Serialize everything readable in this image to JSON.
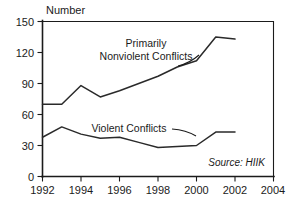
{
  "chart_data": {
    "type": "line",
    "title": "",
    "subtitle": "",
    "xlabel": "",
    "ylabel": "Number",
    "ylabel_position": "above-axis-top",
    "xlim": [
      1992,
      2004
    ],
    "ylim": [
      0,
      150
    ],
    "ytick_values": [
      0,
      30,
      60,
      90,
      120,
      150
    ],
    "ytick_labels": [
      "0",
      "30",
      "60",
      "90",
      "120",
      "150"
    ],
    "xtick_values": [
      1992,
      1994,
      1996,
      1998,
      2000,
      2002,
      2004
    ],
    "xtick_labels": [
      "1992",
      "1994",
      "1996",
      "1998",
      "2000",
      "2002",
      "2004"
    ],
    "grid": false,
    "legend": "inline-annotations",
    "x": [
      1992,
      1993,
      1994,
      1995,
      1996,
      1997,
      1998,
      1999,
      2000,
      2001,
      2002
    ],
    "series": [
      {
        "name": "Primarily Nonviolent Conflicts",
        "label": "Primarily\nNonviolent Conflicts",
        "label_line1": "Primarily",
        "label_line2": "Nonviolent Conflicts",
        "color": "#2a2a2a",
        "values": [
          70,
          70,
          88,
          77,
          83,
          90,
          97,
          106,
          112,
          135,
          133
        ]
      },
      {
        "name": "Violent Conflicts",
        "label": "Violent Conflicts",
        "color": "#2a2a2a",
        "values": [
          38,
          48,
          41,
          37,
          38,
          33,
          28,
          29,
          30,
          43,
          43
        ]
      }
    ],
    "annotations": [
      {
        "name": "source-note",
        "text": "Source: HIIK",
        "style": "italic",
        "position": "bottom-right-inside-plot"
      }
    ]
  },
  "labels": {
    "y_axis_title": "Number",
    "source_note": "Source: HIIK",
    "nonviolent_line1": "Primarily",
    "nonviolent_line2": "Nonviolent Conflicts",
    "violent": "Violent Conflicts"
  },
  "ytick_labels": {
    "t0": "0",
    "t1": "30",
    "t2": "60",
    "t3": "90",
    "t4": "120",
    "t5": "150"
  },
  "xtick_labels": {
    "t0": "1992",
    "t1": "1994",
    "t2": "1996",
    "t3": "1998",
    "t4": "2000",
    "t5": "2002",
    "t6": "2004"
  }
}
